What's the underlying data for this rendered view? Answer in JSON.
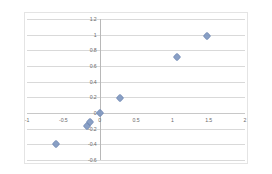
{
  "chart_data": {
    "type": "scatter",
    "title": "",
    "subtitle": "",
    "xlabel": "",
    "ylabel": "",
    "xlim": [
      -1,
      2
    ],
    "ylim": [
      -0.6,
      1.2
    ],
    "grid": true,
    "grid_axis": "y",
    "legend": false,
    "legend_position": "none",
    "marker_shape": "diamond",
    "marker_color": "#8099c2",
    "xticks": [
      -1,
      -0.5,
      0,
      0.5,
      1,
      1.5,
      2
    ],
    "xtick_labels": [
      "-1",
      "-0.5",
      "0",
      "0.5",
      "1",
      "1.5",
      "2"
    ],
    "yticks": [
      -0.6,
      -0.4,
      -0.2,
      0,
      0.2,
      0.4,
      0.6,
      0.8,
      1,
      1.2
    ],
    "ytick_labels": [
      "-0.6",
      "-0.4",
      "-0.2",
      "0",
      "0.2",
      "0.4",
      "0.6",
      "0.8",
      "1",
      "1.2"
    ],
    "series": [
      {
        "name": "Series1",
        "color": "#8099c2",
        "points": [
          {
            "x": -0.6,
            "y": -0.39
          },
          {
            "x": -0.17,
            "y": -0.17
          },
          {
            "x": -0.14,
            "y": -0.11
          },
          {
            "x": 0.0,
            "y": 0.0
          },
          {
            "x": 0.28,
            "y": 0.19
          },
          {
            "x": 1.07,
            "y": 0.72
          },
          {
            "x": 1.48,
            "y": 0.99
          }
        ]
      }
    ]
  },
  "colors": {
    "marker": "#8099c2",
    "gridline": "#d9d9d9",
    "axis": "#b8b8b8",
    "frame": "#e4e4e4",
    "tick_text": "#6a6a6a",
    "background": "#ffffff"
  }
}
